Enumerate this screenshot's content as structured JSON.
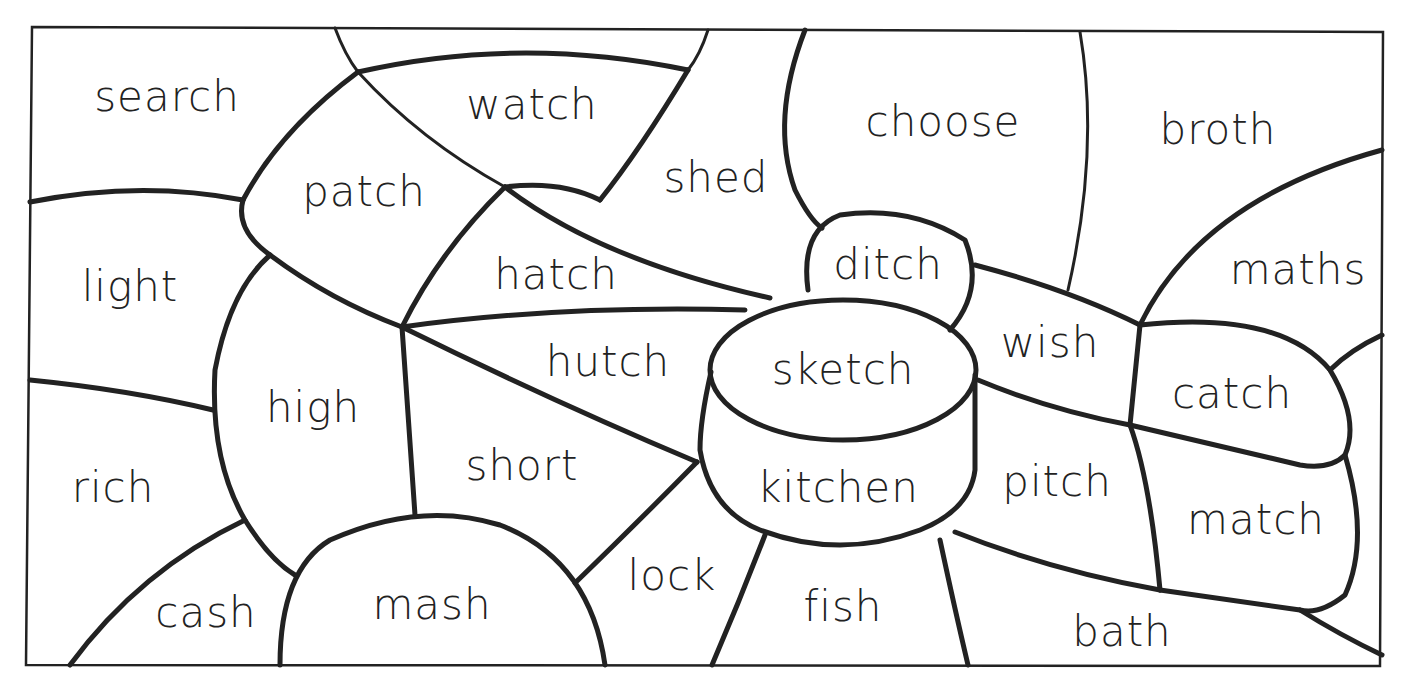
{
  "worksheet": {
    "type": "colour-by-word puzzle",
    "words": [
      {
        "id": "search",
        "label": "search",
        "x": 167,
        "y": 97
      },
      {
        "id": "watch",
        "label": "watch",
        "x": 532,
        "y": 105
      },
      {
        "id": "shed",
        "label": "shed",
        "x": 716,
        "y": 178
      },
      {
        "id": "choose",
        "label": "choose",
        "x": 943,
        "y": 122
      },
      {
        "id": "broth",
        "label": "broth",
        "x": 1218,
        "y": 130
      },
      {
        "id": "patch",
        "label": "patch",
        "x": 364,
        "y": 192
      },
      {
        "id": "light",
        "label": "light",
        "x": 130,
        "y": 287
      },
      {
        "id": "hatch",
        "label": "hatch",
        "x": 556,
        "y": 275
      },
      {
        "id": "ditch",
        "label": "ditch",
        "x": 888,
        "y": 265
      },
      {
        "id": "maths",
        "label": "maths",
        "x": 1298,
        "y": 270
      },
      {
        "id": "hutch",
        "label": "hutch",
        "x": 608,
        "y": 362
      },
      {
        "id": "sketch",
        "label": "sketch",
        "x": 843,
        "y": 370
      },
      {
        "id": "wish",
        "label": "wish",
        "x": 1050,
        "y": 343
      },
      {
        "id": "catch",
        "label": "catch",
        "x": 1232,
        "y": 394
      },
      {
        "id": "high",
        "label": "high",
        "x": 313,
        "y": 408
      },
      {
        "id": "short",
        "label": "short",
        "x": 522,
        "y": 466
      },
      {
        "id": "rich",
        "label": "rich",
        "x": 113,
        "y": 488
      },
      {
        "id": "kitchen",
        "label": "kitchen",
        "x": 838,
        "y": 488
      },
      {
        "id": "pitch",
        "label": "pitch",
        "x": 1057,
        "y": 482
      },
      {
        "id": "match",
        "label": "match",
        "x": 1256,
        "y": 520
      },
      {
        "id": "lock",
        "label": "lock",
        "x": 672,
        "y": 576
      },
      {
        "id": "cash",
        "label": "cash",
        "x": 206,
        "y": 613
      },
      {
        "id": "mash",
        "label": "mash",
        "x": 432,
        "y": 605
      },
      {
        "id": "fish",
        "label": "fish",
        "x": 843,
        "y": 607
      },
      {
        "id": "bath",
        "label": "bath",
        "x": 1122,
        "y": 632
      }
    ]
  }
}
